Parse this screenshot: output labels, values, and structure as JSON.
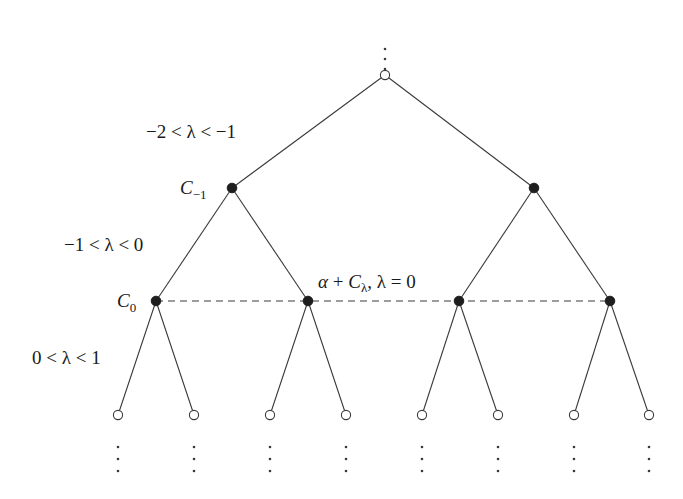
{
  "diagram": {
    "type": "binary-tree",
    "colors": {
      "line": "#3a3a3a",
      "filled_node": "#1e1e1e",
      "open_node_fill": "#ffffff",
      "background": "#ffffff"
    },
    "root": {
      "x": 385,
      "y": 75,
      "style": "open",
      "continuation_above": true
    },
    "levels": [
      {
        "y": 188,
        "style": "filled",
        "xs": [
          232,
          534
        ]
      },
      {
        "y": 301,
        "style": "filled",
        "xs": [
          156,
          308,
          459,
          610
        ]
      },
      {
        "y": 415,
        "style": "open",
        "xs": [
          118,
          194,
          270,
          346,
          422,
          498,
          574,
          649
        ]
      }
    ],
    "dashed_line": {
      "y": 301,
      "x1": 156,
      "x2": 610
    },
    "labels": {
      "edge_level1": "−2 < λ < −1",
      "edge_level2": "−1 < λ < 0",
      "edge_level3": "0 < λ < 1",
      "node_c_minus1": {
        "base": "C",
        "sub": "−1"
      },
      "node_c0": {
        "base": "C",
        "sub": "0"
      },
      "dashed_label": {
        "alpha": "α",
        "plus": " + ",
        "C": "C",
        "sub": "λ",
        "rest": ", λ = 0"
      }
    },
    "continuation_symbol": "⋮"
  }
}
